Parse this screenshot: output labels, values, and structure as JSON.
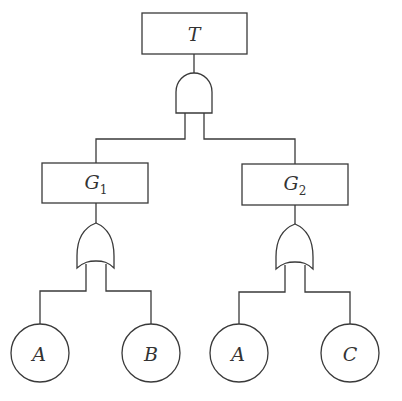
{
  "diagram": {
    "type": "fault-tree",
    "top_event": {
      "label": "T"
    },
    "top_gate": {
      "type": "AND",
      "inputs": [
        "G1",
        "G2"
      ]
    },
    "intermediate_events": [
      {
        "id": "G1",
        "label": "G",
        "subscript": "1",
        "gate": "OR",
        "inputs": [
          "A",
          "B"
        ]
      },
      {
        "id": "G2",
        "label": "G",
        "subscript": "2",
        "gate": "OR",
        "inputs": [
          "A",
          "C"
        ]
      }
    ],
    "basic_events": [
      {
        "label": "A",
        "parent": "G1"
      },
      {
        "label": "B",
        "parent": "G1"
      },
      {
        "label": "A",
        "parent": "G2"
      },
      {
        "label": "C",
        "parent": "G2"
      }
    ],
    "colors": {
      "stroke": "#3a3a3a",
      "background": "#ffffff"
    }
  }
}
